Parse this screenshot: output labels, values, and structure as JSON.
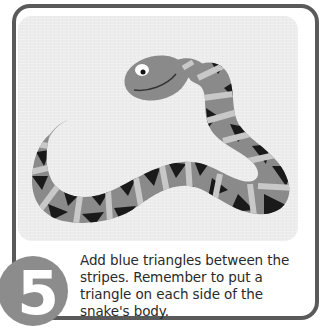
{
  "step": {
    "number": "5",
    "instruction": "Add blue triangles between the stripes. Remember to put a triangle on each side of the snake's body."
  },
  "illustration": {
    "subject": "snake-with-stripes-and-triangles",
    "colors": {
      "border": "#5a5a5a",
      "panel": "#ececec",
      "snake_body": "#8a8a8a",
      "stripe": "#c8c8c8",
      "triangle": "#1a1a1a",
      "step_circle": "#8c8c8c"
    }
  }
}
